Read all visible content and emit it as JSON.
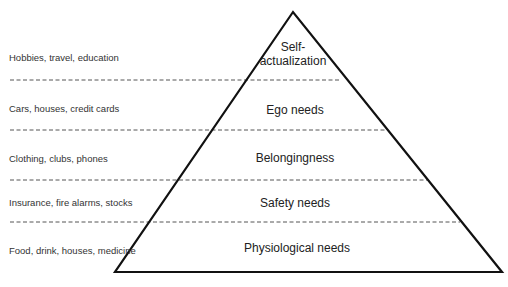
{
  "diagram": {
    "title": "",
    "colors": {
      "outline": "#111111",
      "dashed": "#555555",
      "text": "#222222"
    },
    "pyramid": {
      "apex": [
        293,
        12
      ],
      "base_left": [
        115,
        272
      ],
      "base_right": [
        502,
        272
      ]
    },
    "dividers_y": [
      80,
      130,
      180,
      222
    ],
    "tiers": [
      {
        "label": "Self-\nactualization",
        "line1": "Self-",
        "line2": "actualization",
        "example": "Hobbies, travel, education",
        "label_y": 47,
        "example_y": 57
      },
      {
        "label": "Ego needs",
        "example": "Cars, houses, credit cards",
        "label_y": 108,
        "example_y": 108
      },
      {
        "label": "Belongingness",
        "example": "Clothing, clubs, phones",
        "label_y": 157,
        "example_y": 158
      },
      {
        "label": "Safety needs",
        "example": "Insurance, fire alarms, stocks",
        "label_y": 202,
        "example_y": 202
      },
      {
        "label": "Physiological needs",
        "example": "Food, drink, houses, medicine",
        "label_y": 248,
        "example_y": 250
      }
    ]
  }
}
